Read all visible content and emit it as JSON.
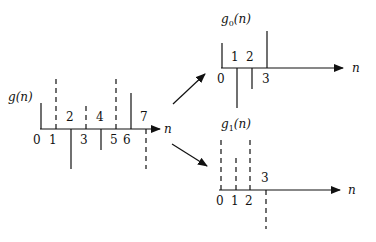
{
  "diagram": {
    "main": {
      "title": "g(n)",
      "axis_label": "n",
      "indices": [
        "0",
        "1",
        "2",
        "3",
        "4",
        "5",
        "6",
        "7"
      ],
      "stem_styles": [
        "solid",
        "dashed",
        "solid",
        "dashed",
        "solid",
        "dashed",
        "solid",
        "dashed"
      ]
    },
    "even": {
      "title_base": "g",
      "title_sub": "0",
      "title_arg": "(n)",
      "axis_label": "n",
      "indices": [
        "0",
        "1",
        "2",
        "3"
      ]
    },
    "odd": {
      "title_base": "g",
      "title_sub": "1",
      "title_arg": "(n)",
      "axis_label": "n",
      "indices": [
        "0",
        "1",
        "2",
        "3"
      ]
    },
    "colors": {
      "ink": "#111111",
      "background": "#ffffff"
    }
  }
}
